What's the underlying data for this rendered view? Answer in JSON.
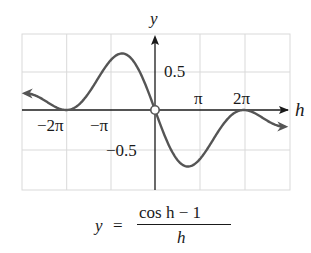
{
  "chart_data": {
    "type": "line",
    "title": "",
    "function": "y = (cos h - 1) / h",
    "xlabel": "h",
    "ylabel": "y",
    "xlim": [
      -9.42,
      9.42
    ],
    "ylim": [
      -1.0,
      1.0
    ],
    "grid": true,
    "x_ticks": [
      {
        "value": -6.2832,
        "label": "−2π"
      },
      {
        "value": -3.1416,
        "label": "−π"
      },
      {
        "value": 3.1416,
        "label": "π"
      },
      {
        "value": 6.2832,
        "label": "2π"
      }
    ],
    "y_ticks": [
      {
        "value": 0.5,
        "label": "0.5"
      },
      {
        "value": -0.5,
        "label": "−0.5"
      }
    ],
    "open_point": {
      "x": 0,
      "y": 0
    },
    "series": [
      {
        "name": "(cos h - 1)/h",
        "x": [
          -9.4,
          -8.5,
          -7.5,
          -6.8,
          -6.28,
          -5.5,
          -4.5,
          -3.5,
          -2.33,
          -1.5,
          -0.8,
          0,
          0.8,
          1.5,
          2.33,
          3.5,
          4.5,
          5.5,
          6.28,
          6.8,
          7.5,
          8.5,
          9.4
        ],
        "y": [
          0.212,
          0.221,
          0.116,
          0.019,
          0.0,
          0.052,
          0.276,
          0.539,
          0.725,
          0.619,
          0.378,
          0.0,
          -0.378,
          -0.619,
          -0.725,
          -0.539,
          -0.276,
          -0.052,
          0.0,
          -0.019,
          -0.116,
          -0.221,
          -0.212
        ]
      }
    ],
    "curve_color": "#555555",
    "axis_color": "#1a1a1a",
    "grid_color": "#d9d9d9"
  },
  "labels": {
    "y_axis": "y",
    "x_axis": "h",
    "xt_neg2pi": "−2π",
    "xt_negpi": "−π",
    "xt_pi": "π",
    "xt_2pi": "2π",
    "yt_pos": "0.5",
    "yt_neg": "−0.5"
  },
  "formula": {
    "lhs": "y",
    "eq": "=",
    "numerator": "cos h − 1",
    "denominator": "h"
  }
}
